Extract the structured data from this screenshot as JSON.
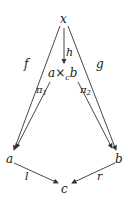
{
  "diagram": {
    "type": "commutative-diagram",
    "nodes": {
      "x": "x",
      "p_a": "a",
      "p_times": "×",
      "p_sub": "c",
      "p_b": "b",
      "a": "a",
      "b": "b",
      "c": "c"
    },
    "arrows": {
      "f": "f",
      "g": "g",
      "h": "h",
      "pi1": "π",
      "pi1_sub": "1",
      "pi2": "π",
      "pi2_sub": "2",
      "l": "l",
      "r": "r"
    }
  }
}
